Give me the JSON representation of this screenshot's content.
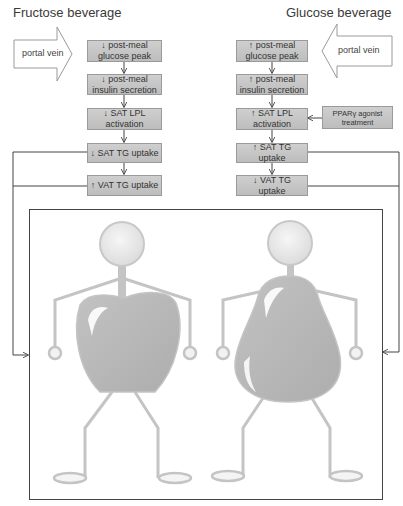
{
  "titles": {
    "left": "Fructose beverage",
    "right": "Glucose beverage"
  },
  "portal_vein": {
    "left_label": "portal vein",
    "right_label": "portal vein"
  },
  "left_chain": [
    {
      "label": "↓ post-meal glucose peak"
    },
    {
      "label": "↓ post-meal insulin secretion"
    },
    {
      "label": "↓ SAT LPL activation"
    },
    {
      "label": "↓ SAT TG uptake"
    },
    {
      "label": "↑ VAT TG uptake"
    }
  ],
  "right_chain": [
    {
      "label": "↑ post-meal glucose peak"
    },
    {
      "label": "↑ post-meal insulin secretion"
    },
    {
      "label": "↑ SAT LPL activation"
    },
    {
      "label": "↑ SAT TG uptake"
    },
    {
      "label": "↓ VAT TG uptake"
    }
  ],
  "side_input": {
    "label": "PPARγ agonist treatment"
  },
  "figures": {
    "left": "apple-shaped body (visceral fat)",
    "right": "pear-shaped body (subcutaneous fat)"
  },
  "colors": {
    "box_fill": "#c6c6c6",
    "box_border": "#9a9a9a",
    "line": "#555555",
    "figure_gray": "#b5b5b5",
    "figure_outline": "#c4c4c4"
  }
}
